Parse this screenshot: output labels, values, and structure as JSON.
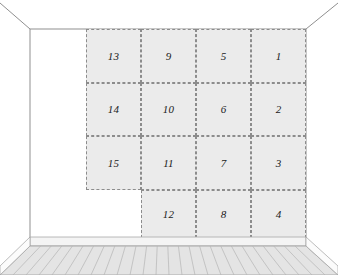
{
  "scene": {
    "title": "Room interior with numbered wall panel grid",
    "width": 338,
    "height": 275
  },
  "colors": {
    "wall": "#ffffff",
    "panel_fill": "#ebebeb",
    "panel_border": "#8c8c8c",
    "outline": "#8f8f8f",
    "floor_fill": "#e2e2e2",
    "floor_plank_line": "#b4b4b4",
    "baseboard": "#f2f2f2",
    "label_text": "#1a1a1a"
  },
  "grid": {
    "columns": 4,
    "rows": 4,
    "panel_count": 15,
    "missing_cell": {
      "column": 1,
      "row": 4
    },
    "cells": [
      {
        "id": "cell-13",
        "column": 1,
        "row": 1,
        "label": "13"
      },
      {
        "id": "cell-9",
        "column": 2,
        "row": 1,
        "label": "9"
      },
      {
        "id": "cell-5",
        "column": 3,
        "row": 1,
        "label": "5"
      },
      {
        "id": "cell-1",
        "column": 4,
        "row": 1,
        "label": "1"
      },
      {
        "id": "cell-14",
        "column": 1,
        "row": 2,
        "label": "14"
      },
      {
        "id": "cell-10",
        "column": 2,
        "row": 2,
        "label": "10"
      },
      {
        "id": "cell-6",
        "column": 3,
        "row": 2,
        "label": "6"
      },
      {
        "id": "cell-2",
        "column": 4,
        "row": 2,
        "label": "2"
      },
      {
        "id": "cell-15",
        "column": 1,
        "row": 3,
        "label": "15"
      },
      {
        "id": "cell-11",
        "column": 2,
        "row": 3,
        "label": "11"
      },
      {
        "id": "cell-7",
        "column": 3,
        "row": 3,
        "label": "7"
      },
      {
        "id": "cell-3",
        "column": 4,
        "row": 3,
        "label": "3"
      },
      {
        "id": "cell-12",
        "column": 2,
        "row": 4,
        "label": "12"
      },
      {
        "id": "cell-8",
        "column": 3,
        "row": 4,
        "label": "8"
      },
      {
        "id": "cell-4",
        "column": 4,
        "row": 4,
        "label": "4"
      }
    ]
  },
  "room": {
    "ceiling_left_label": "ceiling-edge-left",
    "ceiling_right_label": "ceiling-edge-right",
    "back_wall_label": "back-wall",
    "floor_label": "floor",
    "baseboard_label": "baseboard",
    "floor_plank_count": 26
  }
}
